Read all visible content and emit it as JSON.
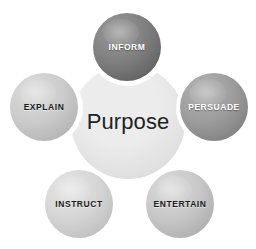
{
  "diagram": {
    "title": "Purpose",
    "center": {
      "label": "Purpose",
      "text_color": "#222222",
      "fill_light": "#ececec",
      "fill_dark": "#d6d6d6"
    },
    "nodes": [
      {
        "id": "inform",
        "label": "INFORM",
        "position": "top",
        "cx": 127,
        "cy": 47,
        "r": 34,
        "text_color": "#ffffff",
        "fill_light": "#9a9a9a",
        "fill_mid": "#7e7e7e",
        "fill_dark": "#5d5d5d"
      },
      {
        "id": "persuade",
        "label": "PERSUADE",
        "position": "right",
        "cx": 214,
        "cy": 107,
        "r": 34,
        "text_color": "#ffffff",
        "fill_light": "#b4b4b4",
        "fill_mid": "#9b9b9b",
        "fill_dark": "#7d7d7d"
      },
      {
        "id": "entertain",
        "label": "ENTERTAIN",
        "position": "bottom-right",
        "cx": 180,
        "cy": 204,
        "r": 34,
        "text_color": "#1a1a1a",
        "fill_light": "#dcdcdc",
        "fill_mid": "#c6c6c6",
        "fill_dark": "#ababab"
      },
      {
        "id": "instruct",
        "label": "INSTRUCT",
        "position": "bottom-left",
        "cx": 79,
        "cy": 204,
        "r": 34,
        "text_color": "#1a1a1a",
        "fill_light": "#e6e6e6",
        "fill_mid": "#d4d4d4",
        "fill_dark": "#bcbcbc"
      },
      {
        "id": "explain",
        "label": "EXPLAIN",
        "position": "left",
        "cx": 44,
        "cy": 107,
        "r": 34,
        "text_color": "#1a1a1a",
        "fill_light": "#dedede",
        "fill_mid": "#cacaca",
        "fill_dark": "#b0b0b0"
      }
    ],
    "background_color": "#ffffff"
  }
}
